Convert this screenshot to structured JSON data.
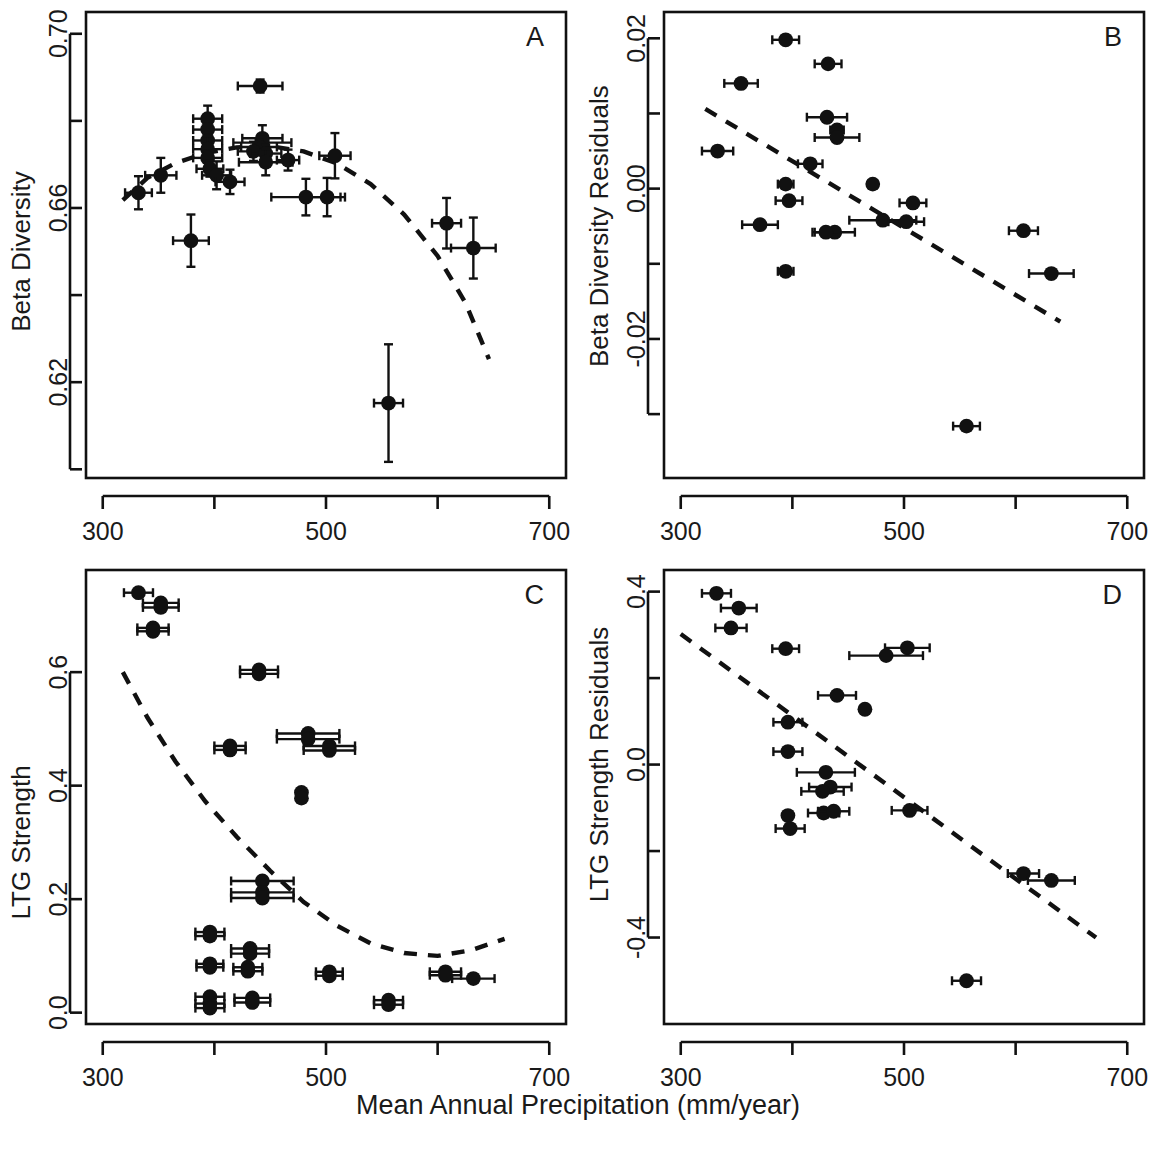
{
  "figure": {
    "shared_xlabel": "Mean Annual Precipitation (mm/year)",
    "panel_letters": [
      "A",
      "B",
      "C",
      "D"
    ]
  },
  "chart_data": [
    {
      "id": "A",
      "type": "scatter",
      "title": "A",
      "xlabel": "Mean Annual Precipitation (mm/year)",
      "ylabel": "Beta Diversity",
      "xlim": [
        285,
        715
      ],
      "ylim": [
        0.598,
        0.705
      ],
      "xticks": [
        300,
        400,
        500,
        600,
        700
      ],
      "xtick_labels": [
        "300",
        "",
        "500",
        "",
        "700"
      ],
      "yticks": [
        0.7,
        0.68,
        0.66,
        0.64,
        0.62,
        0.6
      ],
      "ytick_labels": [
        "0.70",
        "",
        "0.66",
        "",
        "0.62",
        ""
      ],
      "grid": false,
      "legend": "none",
      "errorbars": "both",
      "points": [
        {
          "x": 332,
          "y": 0.6635,
          "xerr": 12,
          "yerr": 0.0038
        },
        {
          "x": 352,
          "y": 0.6675,
          "xerr": 14,
          "yerr": 0.004
        },
        {
          "x": 379,
          "y": 0.6525,
          "xerr": 16,
          "yerr": 0.006
        },
        {
          "x": 394,
          "y": 0.6805,
          "xerr": 13,
          "yerr": 0.003
        },
        {
          "x": 394,
          "y": 0.678,
          "xerr": 13,
          "yerr": 0.0012
        },
        {
          "x": 394,
          "y": 0.6755,
          "xerr": 13,
          "yerr": 0.0012
        },
        {
          "x": 394,
          "y": 0.6735,
          "xerr": 13,
          "yerr": 0.003
        },
        {
          "x": 394,
          "y": 0.6715,
          "xerr": 13,
          "yerr": 0.0022
        },
        {
          "x": 396,
          "y": 0.669,
          "xerr": 12,
          "yerr": 0.0018
        },
        {
          "x": 402,
          "y": 0.6675,
          "xerr": 13,
          "yerr": 0.0032
        },
        {
          "x": 414,
          "y": 0.666,
          "xerr": 13,
          "yerr": 0.0028
        },
        {
          "x": 441,
          "y": 0.688,
          "xerr": 20,
          "yerr": 0.0015
        },
        {
          "x": 443,
          "y": 0.676,
          "xerr": 18,
          "yerr": 0.003
        },
        {
          "x": 443,
          "y": 0.675,
          "xerr": 26,
          "yerr": 0.0018
        },
        {
          "x": 440,
          "y": 0.674,
          "xerr": 16,
          "yerr": 0.0016
        },
        {
          "x": 435,
          "y": 0.673,
          "xerr": 14,
          "yerr": 0.0022
        },
        {
          "x": 446,
          "y": 0.6725,
          "xerr": 14,
          "yerr": 0.002
        },
        {
          "x": 446,
          "y": 0.6705,
          "xerr": 24,
          "yerr": 0.003
        },
        {
          "x": 466,
          "y": 0.671,
          "xerr": 10,
          "yerr": 0.0024
        },
        {
          "x": 482,
          "y": 0.6625,
          "xerr": 31,
          "yerr": 0.0042
        },
        {
          "x": 501,
          "y": 0.6625,
          "xerr": 16,
          "yerr": 0.0044
        },
        {
          "x": 508,
          "y": 0.672,
          "xerr": 14,
          "yerr": 0.0052
        },
        {
          "x": 556,
          "y": 0.6152,
          "xerr": 13,
          "yerr": 0.0135
        },
        {
          "x": 608,
          "y": 0.6565,
          "xerr": 13,
          "yerr": 0.0058
        },
        {
          "x": 632,
          "y": 0.6508,
          "xerr": 20,
          "yerr": 0.007
        }
      ],
      "trend": {
        "shape": "quadratic-downward",
        "x_range": [
          318,
          646
        ],
        "points": [
          [
            318,
            0.6618
          ],
          [
            340,
            0.6669
          ],
          [
            365,
            0.6703
          ],
          [
            392,
            0.6726
          ],
          [
            420,
            0.6739
          ],
          [
            450,
            0.6742
          ],
          [
            480,
            0.673
          ],
          [
            510,
            0.6702
          ],
          [
            540,
            0.6655
          ],
          [
            570,
            0.6585
          ],
          [
            600,
            0.649
          ],
          [
            625,
            0.6382
          ],
          [
            646,
            0.6253
          ]
        ]
      }
    },
    {
      "id": "B",
      "type": "scatter",
      "title": "B",
      "xlabel": "Mean Annual Precipitation (mm/year)",
      "ylabel": "Beta Diversity Residuals",
      "xlim": [
        285,
        715
      ],
      "ylim": [
        -0.0385,
        0.0235
      ],
      "xticks": [
        300,
        400,
        500,
        600,
        700
      ],
      "xtick_labels": [
        "300",
        "",
        "500",
        "",
        "700"
      ],
      "yticks": [
        0.02,
        0.01,
        0.0,
        -0.01,
        -0.02,
        -0.03
      ],
      "ytick_labels": [
        "0.02",
        "",
        "0.00",
        "",
        "-0.02",
        ""
      ],
      "grid": false,
      "legend": "none",
      "errorbars": "x-only",
      "points": [
        {
          "x": 394,
          "y": 0.0198,
          "xerr": 12
        },
        {
          "x": 432,
          "y": 0.0166,
          "xerr": 12
        },
        {
          "x": 354,
          "y": 0.014,
          "xerr": 15
        },
        {
          "x": 431,
          "y": 0.0095,
          "xerr": 18
        },
        {
          "x": 440,
          "y": 0.0078,
          "xerr": 6
        },
        {
          "x": 440,
          "y": 0.0068,
          "xerr": 20
        },
        {
          "x": 333,
          "y": 0.005,
          "xerr": 14
        },
        {
          "x": 416,
          "y": 0.0033,
          "xerr": 11
        },
        {
          "x": 394,
          "y": 0.0006,
          "xerr": 7
        },
        {
          "x": 472,
          "y": 0.0006,
          "xerr": 4
        },
        {
          "x": 397,
          "y": -0.0016,
          "xerr": 12
        },
        {
          "x": 508,
          "y": -0.0019,
          "xerr": 12
        },
        {
          "x": 371,
          "y": -0.0048,
          "xerr": 16
        },
        {
          "x": 481,
          "y": -0.0042,
          "xerr": 30
        },
        {
          "x": 502,
          "y": -0.0044,
          "xerr": 16
        },
        {
          "x": 438,
          "y": -0.0058,
          "xerr": 18
        },
        {
          "x": 430,
          "y": -0.0058,
          "xerr": 12
        },
        {
          "x": 607,
          "y": -0.0056,
          "xerr": 13
        },
        {
          "x": 394,
          "y": -0.011,
          "xerr": 7
        },
        {
          "x": 632,
          "y": -0.0113,
          "xerr": 20
        },
        {
          "x": 556,
          "y": -0.0316,
          "xerr": 12
        }
      ],
      "trend": {
        "shape": "linear-negative",
        "x_range": [
          322,
          640
        ],
        "points": [
          [
            322,
            0.0106
          ],
          [
            640,
            -0.0177
          ]
        ]
      }
    },
    {
      "id": "C",
      "type": "scatter",
      "title": "C",
      "xlabel": "Mean Annual Precipitation (mm/year)",
      "ylabel": "LTG Strength",
      "xlim": [
        285,
        715
      ],
      "ylim": [
        -0.02,
        0.78
      ],
      "xticks": [
        300,
        400,
        500,
        600,
        700
      ],
      "xtick_labels": [
        "300",
        "",
        "500",
        "",
        "700"
      ],
      "yticks": [
        0.0,
        0.2,
        0.4,
        0.6
      ],
      "ytick_labels": [
        "0.0",
        "0.2",
        "0.4",
        "0.6"
      ],
      "grid": false,
      "legend": "none",
      "errorbars": "x-only",
      "points": [
        {
          "x": 332,
          "y": 0.74,
          "xerr": 13
        },
        {
          "x": 352,
          "y": 0.722,
          "xerr": 16
        },
        {
          "x": 352,
          "y": 0.714,
          "xerr": 16
        },
        {
          "x": 345,
          "y": 0.678,
          "xerr": 14
        },
        {
          "x": 345,
          "y": 0.672,
          "xerr": 14
        },
        {
          "x": 440,
          "y": 0.604,
          "xerr": 17
        },
        {
          "x": 440,
          "y": 0.597,
          "xerr": 17
        },
        {
          "x": 484,
          "y": 0.492,
          "xerr": 28
        },
        {
          "x": 484,
          "y": 0.482,
          "xerr": 28
        },
        {
          "x": 414,
          "y": 0.47,
          "xerr": 14
        },
        {
          "x": 414,
          "y": 0.463,
          "xerr": 14
        },
        {
          "x": 503,
          "y": 0.47,
          "xerr": 23
        },
        {
          "x": 503,
          "y": 0.462,
          "xerr": 23
        },
        {
          "x": 478,
          "y": 0.388,
          "xerr": 0
        },
        {
          "x": 478,
          "y": 0.378,
          "xerr": 0
        },
        {
          "x": 443,
          "y": 0.232,
          "xerr": 28
        },
        {
          "x": 443,
          "y": 0.212,
          "xerr": 28
        },
        {
          "x": 443,
          "y": 0.202,
          "xerr": 28
        },
        {
          "x": 396,
          "y": 0.142,
          "xerr": 13
        },
        {
          "x": 396,
          "y": 0.135,
          "xerr": 13
        },
        {
          "x": 432,
          "y": 0.113,
          "xerr": 17
        },
        {
          "x": 432,
          "y": 0.104,
          "xerr": 17
        },
        {
          "x": 396,
          "y": 0.086,
          "xerr": 12
        },
        {
          "x": 396,
          "y": 0.08,
          "xerr": 12
        },
        {
          "x": 430,
          "y": 0.08,
          "xerr": 13
        },
        {
          "x": 430,
          "y": 0.073,
          "xerr": 13
        },
        {
          "x": 503,
          "y": 0.072,
          "xerr": 12
        },
        {
          "x": 503,
          "y": 0.065,
          "xerr": 12
        },
        {
          "x": 607,
          "y": 0.072,
          "xerr": 14
        },
        {
          "x": 607,
          "y": 0.066,
          "xerr": 14
        },
        {
          "x": 632,
          "y": 0.06,
          "xerr": 19
        },
        {
          "x": 396,
          "y": 0.028,
          "xerr": 13
        },
        {
          "x": 396,
          "y": 0.016,
          "xerr": 13
        },
        {
          "x": 396,
          "y": 0.008,
          "xerr": 13
        },
        {
          "x": 434,
          "y": 0.026,
          "xerr": 16
        },
        {
          "x": 434,
          "y": 0.018,
          "xerr": 16
        },
        {
          "x": 556,
          "y": 0.022,
          "xerr": 13
        },
        {
          "x": 556,
          "y": 0.014,
          "xerr": 13
        }
      ],
      "trend": {
        "shape": "quadratic-upward",
        "x_range": [
          318,
          660
        ],
        "points": [
          [
            318,
            0.6
          ],
          [
            340,
            0.52
          ],
          [
            365,
            0.443
          ],
          [
            392,
            0.372
          ],
          [
            420,
            0.31
          ],
          [
            450,
            0.25
          ],
          [
            480,
            0.195
          ],
          [
            510,
            0.153
          ],
          [
            540,
            0.122
          ],
          [
            570,
            0.105
          ],
          [
            600,
            0.1
          ],
          [
            630,
            0.11
          ],
          [
            660,
            0.13
          ]
        ]
      }
    },
    {
      "id": "D",
      "type": "scatter",
      "title": "D",
      "xlabel": "Mean Annual Precipitation (mm/year)",
      "ylabel": "LTG Strength Residuals",
      "xlim": [
        285,
        715
      ],
      "ylim": [
        -0.6,
        0.45
      ],
      "xticks": [
        300,
        400,
        500,
        600,
        700
      ],
      "xtick_labels": [
        "300",
        "",
        "500",
        "",
        "700"
      ],
      "yticks": [
        0.4,
        0.2,
        0.0,
        -0.2,
        -0.4
      ],
      "ytick_labels": [
        "0.4",
        "",
        "0.0",
        "",
        "-0.4"
      ],
      "grid": false,
      "legend": "none",
      "errorbars": "x-only",
      "points": [
        {
          "x": 332,
          "y": 0.396,
          "xerr": 13
        },
        {
          "x": 352,
          "y": 0.362,
          "xerr": 16
        },
        {
          "x": 345,
          "y": 0.316,
          "xerr": 14
        },
        {
          "x": 394,
          "y": 0.268,
          "xerr": 12
        },
        {
          "x": 503,
          "y": 0.27,
          "xerr": 20
        },
        {
          "x": 484,
          "y": 0.252,
          "xerr": 33
        },
        {
          "x": 440,
          "y": 0.16,
          "xerr": 17
        },
        {
          "x": 465,
          "y": 0.128,
          "xerr": 0
        },
        {
          "x": 396,
          "y": 0.098,
          "xerr": 13
        },
        {
          "x": 396,
          "y": 0.03,
          "xerr": 13
        },
        {
          "x": 430,
          "y": -0.018,
          "xerr": 26
        },
        {
          "x": 434,
          "y": -0.052,
          "xerr": 19
        },
        {
          "x": 427,
          "y": -0.062,
          "xerr": 19
        },
        {
          "x": 396,
          "y": -0.118,
          "xerr": 0
        },
        {
          "x": 428,
          "y": -0.112,
          "xerr": 14
        },
        {
          "x": 437,
          "y": -0.108,
          "xerr": 14
        },
        {
          "x": 505,
          "y": -0.106,
          "xerr": 16
        },
        {
          "x": 398,
          "y": -0.148,
          "xerr": 13
        },
        {
          "x": 607,
          "y": -0.252,
          "xerr": 14
        },
        {
          "x": 632,
          "y": -0.268,
          "xerr": 21
        },
        {
          "x": 556,
          "y": -0.5,
          "xerr": 13
        }
      ],
      "trend": {
        "shape": "linear-negative",
        "x_range": [
          300,
          672
        ],
        "points": [
          [
            300,
            0.302
          ],
          [
            672,
            -0.4
          ]
        ]
      }
    }
  ]
}
